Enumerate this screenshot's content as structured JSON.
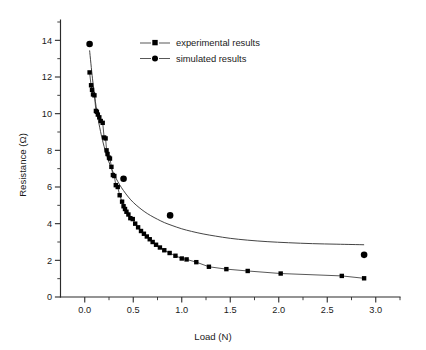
{
  "chart_data": {
    "type": "scatter",
    "title": "",
    "xlabel": "Load (N)",
    "ylabel": "Resistance (Ω)",
    "xlim": [
      -0.25,
      3.25
    ],
    "ylim": [
      0,
      15
    ],
    "grid": false,
    "legend_position": "top-center-left",
    "x_ticks": [
      0.0,
      0.5,
      1.0,
      1.5,
      2.0,
      2.5,
      3.0
    ],
    "x_tick_labels": [
      "0.0",
      "0.5",
      "1.0",
      "1.5",
      "2.0",
      "2.5",
      "3.0"
    ],
    "x_minor_ticks": [
      0.25,
      0.75,
      1.25,
      1.75,
      2.25,
      2.75,
      3.25
    ],
    "y_ticks": [
      0,
      2,
      4,
      6,
      8,
      10,
      12,
      14
    ],
    "y_tick_labels": [
      "0",
      "2",
      "4",
      "6",
      "8",
      "10",
      "12",
      "14"
    ],
    "y_minor_ticks": [
      1,
      3,
      5,
      7,
      9,
      11,
      13,
      15
    ],
    "series": [
      {
        "name": "experimental results",
        "marker": "square",
        "connected": true,
        "color": "#000000",
        "x": [
          0.05,
          0.065,
          0.075,
          0.085,
          0.1,
          0.115,
          0.125,
          0.135,
          0.15,
          0.165,
          0.185,
          0.2,
          0.215,
          0.225,
          0.235,
          0.25,
          0.26,
          0.275,
          0.29,
          0.305,
          0.32,
          0.34,
          0.36,
          0.385,
          0.4,
          0.415,
          0.43,
          0.45,
          0.47,
          0.495,
          0.52,
          0.55,
          0.58,
          0.61,
          0.64,
          0.67,
          0.7,
          0.735,
          0.775,
          0.82,
          0.875,
          0.935,
          1.0,
          1.05,
          1.15,
          1.28,
          1.46,
          1.68,
          2.02,
          2.65,
          2.88
        ],
        "y": [
          12.25,
          11.55,
          11.3,
          11.05,
          11.0,
          10.15,
          10.1,
          9.95,
          9.8,
          9.6,
          9.5,
          8.7,
          8.65,
          8.0,
          7.8,
          7.6,
          7.55,
          7.1,
          6.65,
          6.6,
          6.1,
          6.0,
          5.55,
          5.2,
          4.95,
          4.8,
          4.65,
          4.5,
          4.3,
          4.25,
          4.0,
          3.8,
          3.6,
          3.45,
          3.3,
          3.15,
          3.0,
          2.85,
          2.7,
          2.55,
          2.4,
          2.25,
          2.1,
          2.05,
          1.9,
          1.65,
          1.52,
          1.42,
          1.28,
          1.15,
          1.02
        ]
      },
      {
        "name": "simulated results",
        "marker": "circle",
        "connected": false,
        "color": "#000000",
        "x": [
          0.05,
          0.4,
          0.88,
          2.88
        ],
        "y": [
          13.8,
          6.45,
          4.45,
          2.3
        ]
      }
    ],
    "fit_curve": {
      "name": "simulated fit",
      "x": [
        0.05,
        0.08,
        0.11,
        0.14,
        0.17,
        0.2,
        0.24,
        0.28,
        0.32,
        0.36,
        0.4,
        0.45,
        0.5,
        0.56,
        0.62,
        0.68,
        0.75,
        0.82,
        0.9,
        1.0,
        1.1,
        1.22,
        1.35,
        1.5,
        1.68,
        1.88,
        2.1,
        2.35,
        2.6,
        2.88
      ],
      "y": [
        13.45,
        11.9,
        10.65,
        9.65,
        8.85,
        8.2,
        7.5,
        6.95,
        6.5,
        6.12,
        5.8,
        5.45,
        5.16,
        4.88,
        4.64,
        4.44,
        4.24,
        4.06,
        3.9,
        3.72,
        3.58,
        3.44,
        3.32,
        3.2,
        3.1,
        3.02,
        2.96,
        2.91,
        2.88,
        2.85
      ]
    }
  },
  "legend": {
    "entries": [
      {
        "label": "experimental results",
        "marker": "square-marker"
      },
      {
        "label": "simulated results",
        "marker": "circle-marker"
      }
    ]
  },
  "axes": {
    "x_title": "Load (N)",
    "y_title": "Resistance (Ω)"
  }
}
